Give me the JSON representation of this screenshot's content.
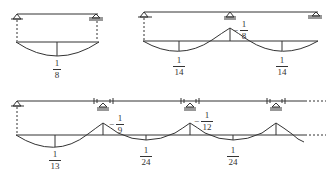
{
  "colors": {
    "line": "#333333",
    "background": "#ffffff"
  },
  "diagrams": [
    {
      "name": "single-span",
      "supports": [
        "pin",
        "roller"
      ],
      "labels": [
        {
          "sign": "",
          "num": "1",
          "den": "8",
          "type": "span"
        }
      ]
    },
    {
      "name": "two-span",
      "supports": [
        "pin",
        "roller",
        "roller"
      ],
      "labels": [
        {
          "sign": "",
          "num": "1",
          "den": "14",
          "type": "span"
        },
        {
          "sign": "−",
          "num": "1",
          "den": "8",
          "type": "support"
        },
        {
          "sign": "",
          "num": "1",
          "den": "14",
          "type": "span"
        }
      ]
    },
    {
      "name": "multi-span",
      "supports": [
        "pin",
        "roller",
        "roller",
        "roller"
      ],
      "continues": true,
      "labels": [
        {
          "sign": "",
          "num": "1",
          "den": "13",
          "type": "span"
        },
        {
          "sign": "−",
          "num": "1",
          "den": "9",
          "type": "support"
        },
        {
          "sign": "",
          "num": "1",
          "den": "24",
          "type": "span"
        },
        {
          "sign": "−",
          "num": "1",
          "den": "12",
          "type": "support"
        },
        {
          "sign": "",
          "num": "1",
          "den": "24",
          "type": "span"
        }
      ]
    }
  ]
}
